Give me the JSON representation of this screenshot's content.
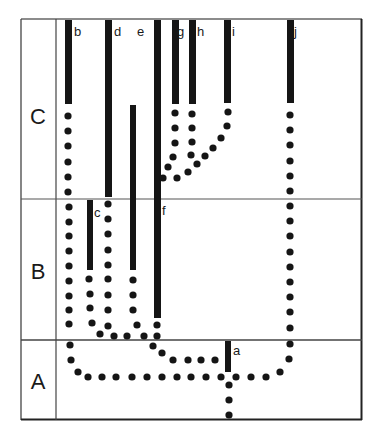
{
  "diagram": {
    "type": "lineage-tree",
    "colors": {
      "ink": "#151515",
      "line": "#555555",
      "background": "#ffffff"
    },
    "rows": [
      {
        "label": "C",
        "y_top": 19,
        "y_bottom": 199
      },
      {
        "label": "B",
        "y_top": 199,
        "y_bottom": 340
      },
      {
        "label": "A",
        "y_top": 340,
        "y_bottom": 420
      }
    ],
    "branches": [
      {
        "label": "a",
        "x": 228,
        "bar": [
          341,
          372
        ]
      },
      {
        "label": "b",
        "x": 68,
        "bar": [
          20,
          104
        ]
      },
      {
        "label": "c",
        "x": 90,
        "bar": [
          200,
          270
        ]
      },
      {
        "label": "d",
        "x": 108,
        "bar": [
          20,
          197
        ]
      },
      {
        "label": "e",
        "x": 133,
        "bar": [
          105,
          270
        ]
      },
      {
        "label": "f",
        "x": 157,
        "bar": [
          20,
          318
        ]
      },
      {
        "label": "g",
        "x": 175,
        "bar": [
          20,
          104
        ]
      },
      {
        "label": "h",
        "x": 192,
        "bar": [
          20,
          104
        ]
      },
      {
        "label": "i",
        "x": 228,
        "bar": [
          20,
          103
        ]
      },
      {
        "label": "j",
        "x": 290,
        "bar": [
          20,
          103
        ]
      }
    ]
  }
}
